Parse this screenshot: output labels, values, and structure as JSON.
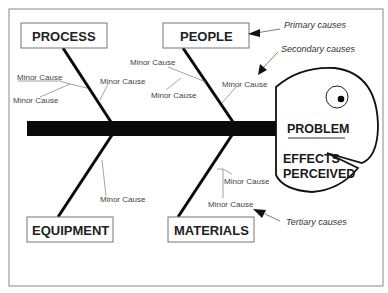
{
  "diagram": {
    "type": "fishbone",
    "problem": {
      "title": "PROBLEM",
      "subtitle_line1": "EFFECTS",
      "subtitle_line2": "PERCEIVED"
    },
    "categories": [
      {
        "label": "PROCESS"
      },
      {
        "label": "PEOPLE"
      },
      {
        "label": "EQUIPMENT"
      },
      {
        "label": "MATERIALS"
      }
    ],
    "minor_causes": {
      "process": [
        "Minor Cause",
        "Minor Cause",
        "Minor Cause"
      ],
      "people": [
        "Minor Cause",
        "Minor Cause",
        "Minor Cause"
      ],
      "equipment": [
        "Minor Cause"
      ],
      "materials": [
        "Minor Cause",
        "Minor Cause"
      ]
    },
    "annotations": {
      "primary": "Primary causes",
      "secondary": "Secondary causes",
      "tertiary": "Tertiary causes"
    }
  }
}
